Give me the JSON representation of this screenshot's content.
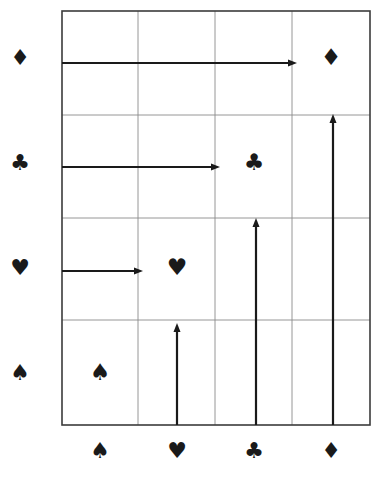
{
  "figure": {
    "title": "",
    "background_color": "#ffffff",
    "width": 380,
    "height": 481
  },
  "chart_data": {
    "type": "scatter",
    "title": "",
    "subtitle": "",
    "xlabel": "",
    "ylabel": "",
    "grid": true,
    "legend_position": "none",
    "categories": [
      "spade",
      "heart",
      "club",
      "diamond"
    ],
    "x_tick_labels": [
      "♠",
      "♥",
      "♣",
      "♦"
    ],
    "x_tick_names": [
      "spade",
      "heart",
      "club",
      "diamond"
    ],
    "y_tick_labels": [
      "♦",
      "♣",
      "♥",
      "♠"
    ],
    "y_tick_names": [
      "diamond",
      "club",
      "heart",
      "spade"
    ],
    "xlim": [
      0,
      4
    ],
    "ylim": [
      0,
      4
    ],
    "points": [
      {
        "name": "point-diamond-diamond",
        "glyph": "♦",
        "x_label": "diamond",
        "y_label": "diamond",
        "x": 4,
        "y": 4,
        "px": 331,
        "py": 57,
        "size": 23
      },
      {
        "name": "point-club-club",
        "glyph": "♣",
        "x_label": "club",
        "y_label": "club",
        "x": 3,
        "y": 3,
        "px": 254,
        "py": 162,
        "size": 23
      },
      {
        "name": "point-heart-heart",
        "glyph": "♥",
        "x_label": "heart",
        "y_label": "heart",
        "x": 2,
        "y": 2,
        "px": 177,
        "py": 267,
        "size": 23
      },
      {
        "name": "point-spade-spade",
        "glyph": "♠",
        "x_label": "spade",
        "y_label": "spade",
        "x": 1,
        "y": 1,
        "px": 100,
        "py": 372,
        "size": 23
      }
    ],
    "series": [
      {
        "name": "suit-pairs",
        "values": [
          4,
          3,
          2,
          1
        ]
      }
    ]
  },
  "axes": {
    "frame": {
      "x0": 62,
      "y0": 11,
      "x1": 370,
      "y1": 425,
      "border_color": "#3b3b3b",
      "border_width": 1.6
    },
    "grid_color": "#8a8a8a",
    "grid_width": 0.9,
    "vertical_gridlines": [
      138,
      215,
      292
    ],
    "horizontal_gridlines": [
      115,
      218,
      320
    ]
  },
  "y_axis_labels": [
    {
      "name": "y-label-diamond",
      "glyph": "♦",
      "px": 20,
      "py": 57,
      "size": 22
    },
    {
      "name": "y-label-club",
      "glyph": "♣",
      "px": 20,
      "py": 162,
      "size": 22
    },
    {
      "name": "y-label-heart",
      "glyph": "♥",
      "px": 20,
      "py": 267,
      "size": 22
    },
    {
      "name": "y-label-spade",
      "glyph": "♠",
      "px": 20,
      "py": 372,
      "size": 22
    }
  ],
  "x_axis_labels": [
    {
      "name": "x-label-spade",
      "glyph": "♠",
      "px": 100,
      "py": 450,
      "size": 22
    },
    {
      "name": "x-label-heart",
      "glyph": "♥",
      "px": 177,
      "py": 450,
      "size": 22
    },
    {
      "name": "x-label-club",
      "glyph": "♣",
      "px": 254,
      "py": 450,
      "size": 22
    },
    {
      "name": "x-label-diamond",
      "glyph": "♦",
      "px": 331,
      "py": 450,
      "size": 22
    }
  ],
  "arrows": {
    "color": "#1a1a1a",
    "width": 2.2,
    "head_length": 9,
    "head_width": 7,
    "horizontal": [
      {
        "name": "arrow-h-diamond",
        "from_label": "diamond",
        "x_start": 62,
        "x_end": 297,
        "y": 63
      },
      {
        "name": "arrow-h-club",
        "from_label": "club",
        "x_start": 62,
        "x_end": 220,
        "y": 167
      },
      {
        "name": "arrow-h-heart",
        "from_label": "heart",
        "x_start": 62,
        "x_end": 143,
        "y": 271
      }
    ],
    "vertical": [
      {
        "name": "arrow-v-heart",
        "from_label": "heart",
        "x": 177,
        "y_start": 425,
        "y_end": 323
      },
      {
        "name": "arrow-v-club",
        "from_label": "club",
        "x": 256,
        "y_start": 425,
        "y_end": 218
      },
      {
        "name": "arrow-v-diamond",
        "from_label": "diamond",
        "x": 333,
        "y_start": 425,
        "y_end": 114
      }
    ]
  }
}
